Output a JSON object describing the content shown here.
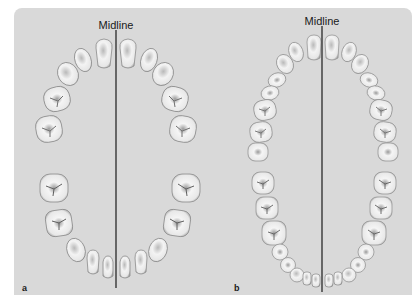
{
  "figure": {
    "panels": [
      {
        "id": "a",
        "label": "a",
        "midline_label": "Midline",
        "dentition": "primary",
        "upper_teeth_count": 10,
        "lower_teeth_count": 10
      },
      {
        "id": "b",
        "label": "b",
        "midline_label": "Midline",
        "dentition": "permanent",
        "upper_teeth_count": 16,
        "lower_teeth_count": 16
      }
    ],
    "colors": {
      "background": "#d9d9d9",
      "tooth_fill": "#f4f4f4",
      "tooth_shade": "#b5b5b5",
      "tooth_outline": "#8c8c8c",
      "midline": "#1a1a1a"
    }
  }
}
